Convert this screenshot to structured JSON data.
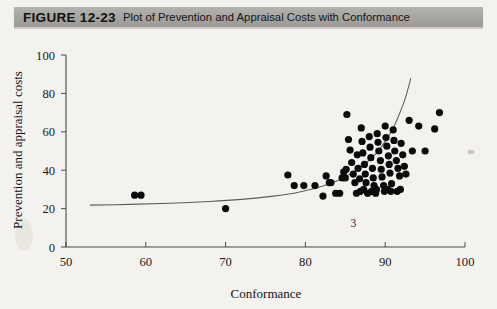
{
  "figure": {
    "number_label": "FIGURE 12-23",
    "caption": "Plot of Prevention and Appraisal Costs with Conformance",
    "header_bg": "#a6a4a0",
    "page_bg": "#f4f2ee"
  },
  "annotations": [
    {
      "name": "curve-index-label",
      "text": "3",
      "x": 86.0,
      "y": 10.5
    }
  ],
  "chart_data": {
    "type": "scatter",
    "title": "Plot of Prevention and Appraisal Costs with Conformance",
    "xlabel": "Conformance",
    "ylabel": "Prevention and appraisal costs",
    "xlim": [
      50,
      100
    ],
    "ylim": [
      0,
      100
    ],
    "xticks": [
      50,
      60,
      70,
      80,
      90,
      100
    ],
    "yticks": [
      0,
      20,
      40,
      60,
      80,
      100
    ],
    "xtick_labels": [
      "50",
      "60",
      "70",
      "80",
      "90",
      "100"
    ],
    "ytick_labels": [
      "0",
      "20",
      "40",
      "60",
      "80",
      "100"
    ],
    "grid": false,
    "legend": "none",
    "marker": {
      "shape": "circle",
      "color": "#0b0b0b",
      "size_px": 7.2
    },
    "series": [
      {
        "name": "Prevention and appraisal costs vs Conformance",
        "marker_color": "#0b0b0b",
        "x": [
          58.6,
          59.4,
          70.0,
          77.8,
          78.6,
          79.8,
          81.2,
          82.2,
          83.0,
          83.2,
          83.8,
          84.3,
          84.6,
          85.0,
          85.2,
          85.4,
          85.6,
          85.8,
          86.0,
          86.2,
          86.4,
          86.5,
          86.6,
          86.8,
          87.0,
          87.1,
          87.2,
          87.4,
          87.5,
          87.6,
          87.8,
          88.0,
          88.1,
          88.2,
          88.4,
          88.5,
          88.6,
          88.8,
          89.0,
          89.1,
          89.2,
          89.4,
          89.5,
          89.6,
          89.8,
          90.0,
          90.1,
          90.2,
          90.4,
          90.5,
          90.6,
          90.8,
          91.0,
          91.1,
          91.2,
          91.4,
          91.6,
          91.8,
          92.0,
          92.2,
          92.4,
          92.6,
          93.0,
          93.4,
          94.2,
          95.0,
          96.2,
          96.8,
          84.8,
          86.9,
          88.3,
          89.9,
          90.7,
          91.5,
          82.6,
          85.1,
          87.3,
          88.9,
          90.3,
          91.9
        ],
        "y": [
          27.0,
          27.0,
          20.0,
          37.5,
          32.0,
          32.0,
          32.0,
          26.5,
          33.5,
          33.5,
          28.0,
          28.0,
          36.0,
          36.0,
          69.0,
          56.0,
          50.5,
          44.0,
          38.0,
          33.5,
          28.0,
          48.0,
          41.0,
          35.5,
          62.0,
          55.0,
          49.0,
          43.0,
          38.0,
          33.5,
          28.0,
          57.5,
          52.0,
          46.5,
          41.0,
          36.0,
          32.0,
          28.0,
          59.0,
          54.5,
          50.0,
          45.0,
          40.5,
          36.5,
          32.0,
          63.0,
          57.0,
          52.5,
          47.5,
          43.0,
          38.5,
          33.0,
          61.0,
          55.5,
          50.0,
          45.0,
          41.0,
          37.0,
          54.0,
          48.0,
          42.0,
          38.0,
          66.0,
          50.0,
          63.0,
          50.0,
          61.5,
          70.0,
          39.0,
          29.0,
          29.0,
          29.0,
          29.0,
          29.0,
          37.0,
          40.5,
          30.0,
          30.0,
          30.0,
          30.0
        ]
      }
    ],
    "fit_curve": {
      "name": "fitted exponential trend",
      "color": "#5d5d5d",
      "x": [
        53.0,
        58.0,
        63.0,
        68.0,
        72.0,
        76.0,
        79.0,
        82.0,
        84.0,
        86.0,
        87.5,
        88.8,
        90.0,
        91.0,
        91.8,
        92.4,
        92.9,
        93.2
      ],
      "y": [
        21.8,
        22.2,
        22.8,
        23.7,
        24.8,
        26.5,
        28.4,
        31.5,
        34.5,
        39.0,
        43.5,
        48.5,
        55.0,
        62.0,
        69.5,
        76.0,
        83.0,
        88.0
      ]
    }
  }
}
